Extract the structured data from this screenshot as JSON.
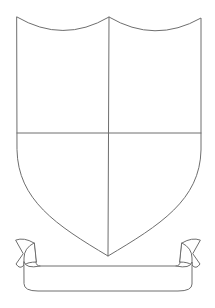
{
  "image": {
    "subject": "blank heraldic shield template with banner ribbon",
    "background_color": "#ffffff",
    "line_color": "#6e6e6e"
  },
  "shield": {
    "quarters": 4,
    "divisions": [
      "vertical-center",
      "horizontal-middle"
    ],
    "top_edge": "double-scalloped"
  },
  "ribbon": {
    "text": ""
  }
}
